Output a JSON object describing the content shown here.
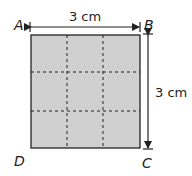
{
  "diagram": {
    "shape": "square",
    "grid": {
      "rows": 3,
      "cols": 3,
      "line_style": "dashed"
    },
    "fill_color": "#d0d0d0",
    "stroke_color": "#222222",
    "vertices": {
      "top_left": "A",
      "top_right": "B",
      "bottom_right": "C",
      "bottom_left": "D"
    },
    "dimensions": {
      "top": "3 cm",
      "right": "3 cm"
    }
  }
}
